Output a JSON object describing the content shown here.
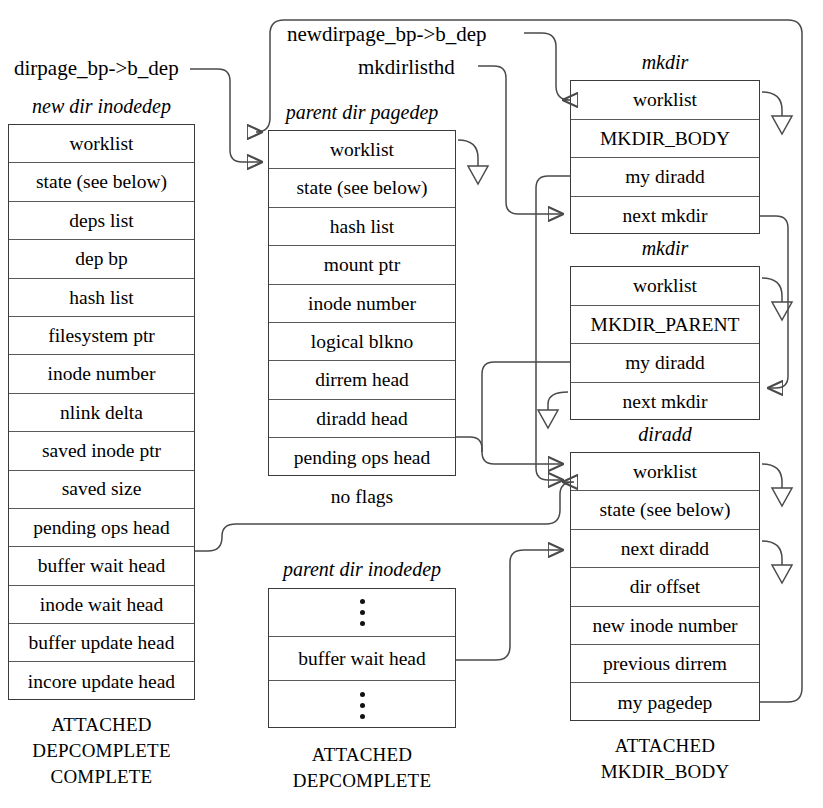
{
  "diagram": {
    "pointer_labels": [
      {
        "id": "dirpage",
        "text": "dirpage_bp->b_dep"
      },
      {
        "id": "newdirpage",
        "text": "newdirpage_bp->b_dep"
      },
      {
        "id": "mkdirlisthd",
        "text": "mkdirlisthd"
      }
    ],
    "structures": [
      {
        "id": "new-dir-inodedep",
        "caption": "new dir inodedep",
        "fields": [
          "worklist",
          "state (see below)",
          "deps list",
          "dep bp",
          "hash list",
          "filesystem ptr",
          "inode number",
          "nlink delta",
          "saved inode ptr",
          "saved size",
          "pending ops head",
          "buffer wait head",
          "inode wait head",
          "buffer update head",
          "incore update head"
        ],
        "flags": [
          "ATTACHED",
          "DEPCOMPLETE",
          "COMPLETE"
        ]
      },
      {
        "id": "parent-dir-pagedep",
        "caption": "parent dir pagedep",
        "fields": [
          "worklist",
          "state (see below)",
          "hash list",
          "mount ptr",
          "inode number",
          "logical blkno",
          "dirrem head",
          "diradd head",
          "pending ops head"
        ],
        "subcaption": "no flags",
        "flags": []
      },
      {
        "id": "parent-dir-inodedep",
        "caption": "parent dir inodedep",
        "fields": [
          "⋮",
          "buffer wait head",
          "⋮"
        ],
        "flags": [
          "ATTACHED",
          "DEPCOMPLETE"
        ]
      },
      {
        "id": "mkdir-body",
        "caption": "mkdir",
        "fields": [
          "worklist",
          "MKDIR_BODY",
          "my diradd",
          "next mkdir"
        ],
        "flags": []
      },
      {
        "id": "mkdir-parent",
        "caption": "mkdir",
        "fields": [
          "worklist",
          "MKDIR_PARENT",
          "my diradd",
          "next mkdir"
        ],
        "flags": []
      },
      {
        "id": "diradd",
        "caption": "diradd",
        "fields": [
          "worklist",
          "state (see below)",
          "next diradd",
          "dir offset",
          "new inode number",
          "previous dirrem",
          "my pagedep"
        ],
        "flags": [
          "ATTACHED",
          "MKDIR_BODY"
        ]
      }
    ],
    "connections": [
      {
        "from": "dirpage_bp->b_dep",
        "to": "parent dir pagedep worklist"
      },
      {
        "from": "newdirpage_bp->b_dep",
        "to": "mkdir MKDIR_BODY worklist"
      },
      {
        "from": "mkdirlisthd",
        "to": "mkdir MKDIR_BODY next mkdir"
      },
      {
        "from": "mkdir MKDIR_BODY next mkdir",
        "to": "mkdir MKDIR_PARENT next mkdir"
      },
      {
        "from": "mkdir MKDIR_BODY my diradd",
        "to": "diradd worklist"
      },
      {
        "from": "mkdir MKDIR_PARENT my diradd",
        "to": "diradd worklist"
      },
      {
        "from": "parent dir pagedep diradd head",
        "to": "diradd worklist"
      },
      {
        "from": "new dir inodedep buffer wait head",
        "to": "diradd state"
      },
      {
        "from": "parent dir inodedep buffer wait head",
        "to": "diradd next diradd"
      },
      {
        "from": "diradd my pagedep",
        "to": "parent dir pagedep worklist"
      }
    ],
    "colors": {
      "line": "#4a4a4a",
      "border": "#3b3b3b",
      "text": "#000000"
    }
  }
}
